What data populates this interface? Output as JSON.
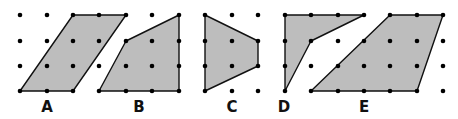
{
  "figure": {
    "fill_color": "#bdbdbd",
    "stroke_color": "#111111",
    "dot_color": "#000000"
  },
  "shapes": [
    {
      "label": "A",
      "points": "73,15 126,15 73,91 20,91",
      "label_x": 47
    },
    {
      "label": "B",
      "points": "126,41 179,15 179,91 99,91",
      "label_x": 139
    },
    {
      "label": "C",
      "points": "205,15 258,41 258,66 205,91",
      "label_x": 232
    },
    {
      "label": "D",
      "points": "285,15 364,15 311,41 285,91",
      "label_x": 284
    },
    {
      "label": "E",
      "points": "390,15 443,15 417,91 311,91",
      "label_x": 364
    }
  ],
  "grids": [
    {
      "xs": [
        20,
        47,
        73,
        99,
        126,
        152,
        179
      ],
      "ys": [
        15,
        41,
        66,
        91
      ]
    },
    {
      "xs": [
        205,
        232,
        258
      ],
      "ys": [
        15,
        41,
        66,
        91
      ]
    },
    {
      "xs": [
        285,
        311,
        338,
        364,
        390,
        417,
        443
      ],
      "ys": [
        15,
        41,
        66,
        91
      ]
    }
  ]
}
